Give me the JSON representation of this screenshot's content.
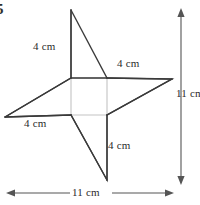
{
  "figure": {
    "problem_number": "5",
    "background_color": "#ffffff",
    "stroke_color": "#3a3a3a",
    "guide_color": "#bdbdbd",
    "labels": {
      "side_top_left": "4 cm",
      "side_right": "4 cm",
      "side_bottom_left": "4 cm",
      "side_bottom": "4 cm",
      "dimension_vertical": "11 cm",
      "dimension_horizontal": "11 cm"
    },
    "shape": {
      "type": "four-pointed-star",
      "outer_points": [
        {
          "name": "top",
          "x": 71,
          "y": 10
        },
        {
          "name": "right",
          "x": 172,
          "y": 79
        },
        {
          "name": "bottom",
          "x": 107,
          "y": 180
        },
        {
          "name": "left",
          "x": 5,
          "y": 117
        }
      ],
      "inner_points": [
        {
          "name": "inner-top-left",
          "x": 71,
          "y": 78
        },
        {
          "name": "inner-top-right",
          "x": 107,
          "y": 78
        },
        {
          "name": "inner-bottom-right",
          "x": 107,
          "y": 115
        },
        {
          "name": "inner-bottom-left",
          "x": 71,
          "y": 115
        }
      ]
    },
    "dimensions": {
      "vertical": {
        "x": 181,
        "y_start": 10,
        "y_end": 183,
        "value": 11,
        "unit": "cm"
      },
      "horizontal": {
        "y": 193,
        "x_start": 8,
        "x_end": 172,
        "value": 11,
        "unit": "cm"
      }
    }
  }
}
